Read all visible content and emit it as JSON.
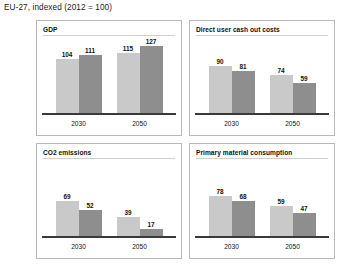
{
  "caption": "EU-27, indexed (2012 = 100)",
  "colors": {
    "light_bar": "#c9c9c9",
    "dark_bar": "#8e8e8e",
    "axis": "#3a3a3a",
    "panel_border": "#b9b9b9",
    "background": "#ffffff"
  },
  "chart_data": [
    {
      "type": "bar",
      "title": "GDP",
      "categories": [
        "2030",
        "2050"
      ],
      "series": [
        {
          "name": "light",
          "values": [
            104,
            111
          ]
        },
        {
          "name": "dark",
          "values": [
            115,
            127
          ]
        }
      ],
      "bars": [
        {
          "group": "2030",
          "shade": "light",
          "value": 104
        },
        {
          "group": "2030",
          "shade": "dark",
          "value": 111
        },
        {
          "group": "2050",
          "shade": "light",
          "value": 115
        },
        {
          "group": "2050",
          "shade": "dark",
          "value": 127
        }
      ],
      "xlabel": "",
      "ylabel": "",
      "ylim": [
        0,
        140
      ],
      "grid": false,
      "legend": "none"
    },
    {
      "type": "bar",
      "title": "Direct user cash out costs",
      "categories": [
        "2030",
        "2050"
      ],
      "bars": [
        {
          "group": "2030",
          "shade": "light",
          "value": 90
        },
        {
          "group": "2030",
          "shade": "dark",
          "value": 81
        },
        {
          "group": "2050",
          "shade": "light",
          "value": 74
        },
        {
          "group": "2050",
          "shade": "dark",
          "value": 59
        }
      ],
      "xlabel": "",
      "ylabel": "",
      "ylim": [
        0,
        140
      ],
      "grid": false,
      "legend": "none"
    },
    {
      "type": "bar",
      "title": "CO2 emissions",
      "categories": [
        "2030",
        "2050"
      ],
      "bars": [
        {
          "group": "2030",
          "shade": "light",
          "value": 69
        },
        {
          "group": "2030",
          "shade": "dark",
          "value": 52
        },
        {
          "group": "2050",
          "shade": "light",
          "value": 39
        },
        {
          "group": "2050",
          "shade": "dark",
          "value": 17
        }
      ],
      "xlabel": "",
      "ylabel": "",
      "ylim": [
        0,
        140
      ],
      "grid": false,
      "legend": "none"
    },
    {
      "type": "bar",
      "title": "Primary material consumption",
      "categories": [
        "2030",
        "2050"
      ],
      "bars": [
        {
          "group": "2030",
          "shade": "light",
          "value": 78
        },
        {
          "group": "2030",
          "shade": "dark",
          "value": 68
        },
        {
          "group": "2050",
          "shade": "light",
          "value": 59
        },
        {
          "group": "2050",
          "shade": "dark",
          "value": 47
        }
      ],
      "xlabel": "",
      "ylabel": "",
      "ylim": [
        0,
        140
      ],
      "grid": false,
      "legend": "none"
    }
  ]
}
